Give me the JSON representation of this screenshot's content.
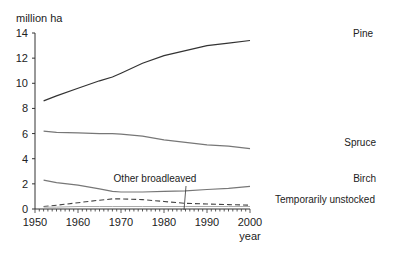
{
  "chart_data": {
    "type": "line",
    "title": "",
    "ylabel": "million ha",
    "xlabel": "year",
    "xlim": [
      1950,
      2000
    ],
    "ylim": [
      0,
      14
    ],
    "x_ticks": [
      "1950",
      "1960",
      "1970",
      "1980",
      "1990",
      "2000"
    ],
    "y_ticks": [
      "0",
      "2",
      "4",
      "6",
      "8",
      "10",
      "12",
      "14"
    ],
    "grid": false,
    "legend": "inline labels",
    "x": [
      1952,
      1955,
      1960,
      1965,
      1968,
      1970,
      1975,
      1980,
      1985,
      1990,
      1995,
      2000
    ],
    "series": [
      {
        "name": "Pine",
        "style": "solid",
        "values": [
          8.6,
          9.0,
          9.6,
          10.2,
          10.5,
          10.8,
          11.6,
          12.2,
          12.6,
          13.0,
          13.2,
          13.4
        ]
      },
      {
        "name": "Spruce",
        "style": "solid",
        "values": [
          6.2,
          6.1,
          6.05,
          6.0,
          6.0,
          5.95,
          5.8,
          5.5,
          5.3,
          5.1,
          5.0,
          4.8
        ]
      },
      {
        "name": "Birch",
        "style": "solid",
        "values": [
          2.3,
          2.1,
          1.9,
          1.6,
          1.4,
          1.35,
          1.35,
          1.4,
          1.45,
          1.55,
          1.65,
          1.8
        ]
      },
      {
        "name": "Other broadleaved",
        "style": "dashed",
        "values": [
          0.2,
          0.3,
          0.5,
          0.7,
          0.8,
          0.8,
          0.75,
          0.6,
          0.45,
          0.4,
          0.35,
          0.3
        ]
      },
      {
        "name": "Temporarily unstocked",
        "style": "solid-light",
        "values": [
          0.15,
          0.15,
          0.2,
          0.2,
          0.2,
          0.2,
          0.2,
          0.2,
          0.2,
          0.2,
          0.2,
          0.2
        ]
      }
    ]
  },
  "labels": {
    "ylabel": "million ha",
    "xlabel": "year",
    "pine": "Pine",
    "spruce": "Spruce",
    "birch": "Birch",
    "other": "Other broadleaved",
    "unstocked": "Temporarily unstocked"
  }
}
